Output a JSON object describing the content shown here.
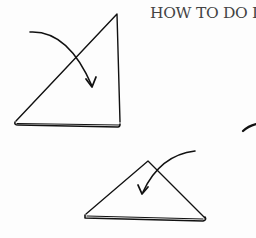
{
  "page": {
    "heading": "HOW TO DO IT",
    "ink_color": "#111111",
    "heading_color": "#444444"
  },
  "illustrations": [
    {
      "name": "step-1-triangle-fold",
      "description": "Tall right triangle with curved arrow indicating fold"
    },
    {
      "name": "step-2-triangle-fold",
      "description": "Flattened triangle with curved arrow indicating fold"
    },
    {
      "name": "partial-arrow",
      "description": "Cropped stroke at right edge"
    }
  ]
}
